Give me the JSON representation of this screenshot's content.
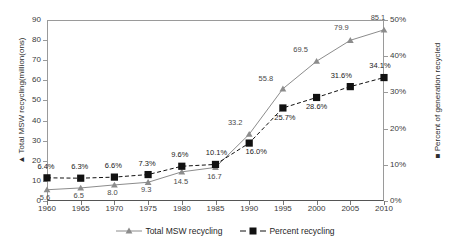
{
  "chart_data": {
    "type": "line",
    "title": "",
    "xlabel": "",
    "ylabel": "▲ Total MSW recycling(million(ons)",
    "ylabel_right": "■ Percent of generation recycled",
    "x": [
      1960,
      1965,
      1970,
      1975,
      1980,
      1985,
      1990,
      1995,
      2000,
      2005,
      2010
    ],
    "xtick_labels": [
      "1960",
      "1965",
      "1970",
      "1975",
      "1980",
      "1985",
      "1990",
      "1995",
      "2000",
      "2005",
      "2010"
    ],
    "ytick_labels": [
      "0",
      "10",
      "20",
      "30",
      "40",
      "50",
      "60",
      "70",
      "80",
      "90"
    ],
    "ytick_values": [
      0,
      10,
      20,
      30,
      40,
      50,
      60,
      70,
      80,
      90
    ],
    "ytick_labels_right": [
      "0%",
      "10%",
      "20%",
      "30%",
      "40%",
      "50%"
    ],
    "ytick_values_right": [
      0,
      10,
      20,
      30,
      40,
      50
    ],
    "ylim": [
      0,
      90
    ],
    "ylim_right": [
      0,
      50
    ],
    "xlim": [
      1960,
      2010
    ],
    "grid": false,
    "legend_position": "bottom",
    "series": [
      {
        "name": "Total MSW recycling",
        "axis": "left",
        "marker": "triangle",
        "color": "#8c8c8c",
        "linestyle": "solid",
        "values": [
          5.6,
          6.5,
          8.0,
          9.3,
          14.5,
          16.7,
          33.2,
          55.8,
          69.5,
          79.9,
          85.1
        ],
        "labels": [
          "5.6",
          "6.5",
          "8.0",
          "9.3",
          "14.5",
          "16.7",
          "33.2",
          "55.8",
          "69.5",
          "79.9",
          "85.1"
        ]
      },
      {
        "name": "Percent recycling",
        "axis": "right",
        "marker": "square",
        "color": "#111111",
        "linestyle": "dashed",
        "values": [
          6.4,
          6.3,
          6.6,
          7.3,
          9.6,
          10.1,
          16.0,
          25.7,
          28.6,
          31.6,
          34.1
        ],
        "labels": [
          "6.4%",
          "6.3%",
          "6.6%",
          "7.3%",
          "9.6%",
          "10.1%",
          "16.0%",
          "25.7%",
          "28.6%",
          "31.6%",
          "34.1%"
        ]
      }
    ]
  },
  "legend": {
    "items": [
      {
        "label": "Total MSW recycling",
        "marker": "triangle-marker",
        "color": "#8c8c8c"
      },
      {
        "label": "Percent recycling",
        "marker": "square-marker",
        "color": "#111111"
      }
    ]
  }
}
